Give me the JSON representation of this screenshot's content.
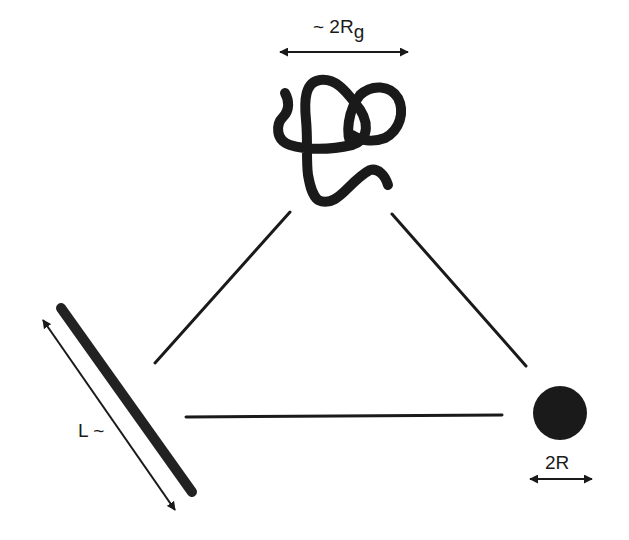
{
  "diagram": {
    "colors": {
      "ink": "#1a1a1a",
      "background": "#ffffff"
    },
    "coil": {
      "label_prefix": "~ 2R",
      "label_subscript": "g"
    },
    "rod": {
      "label": "L ~"
    },
    "sphere": {
      "label": "2R"
    },
    "connections": [
      {
        "from": "coil",
        "to": "rod"
      },
      {
        "from": "coil",
        "to": "sphere"
      },
      {
        "from": "rod",
        "to": "sphere"
      }
    ]
  }
}
